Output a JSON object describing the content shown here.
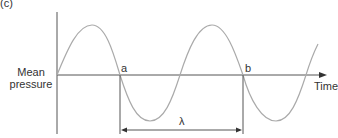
{
  "figure": {
    "panel_label": "(c)",
    "y_axis_label_line1": "Mean",
    "y_axis_label_line2": "pressure",
    "x_axis_label": "Time",
    "point_a_label": "a",
    "point_b_label": "b",
    "wavelength_label": "λ",
    "colors": {
      "axis": "#555555",
      "wave": "#aaaaaa",
      "text": "#333333"
    }
  }
}
